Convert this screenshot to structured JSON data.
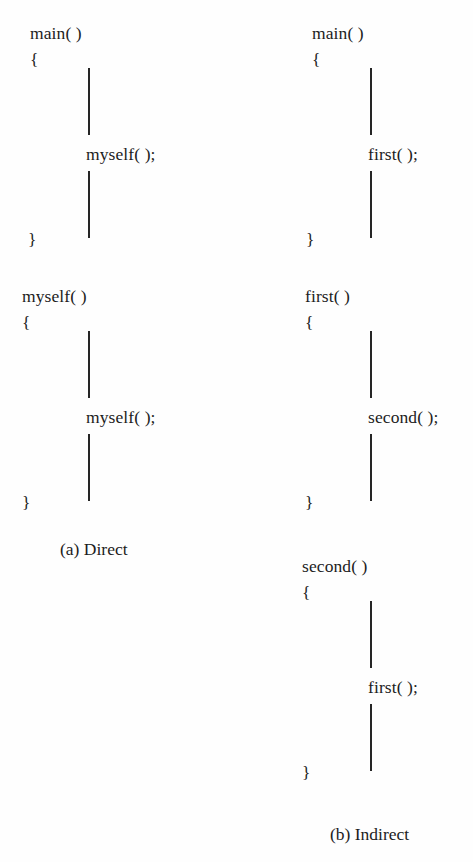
{
  "figure": {
    "title_alt": "Direct and Indirect Recursion",
    "background_color": "#ffffff",
    "text_color": "#1c1c1c",
    "line_color": "#262626"
  },
  "left_column": {
    "caption": "(a) Direct",
    "blocks": [
      {
        "name": "main-block",
        "header": "main( )",
        "open_brace": "{",
        "call": "myself( );",
        "close_brace": "}"
      },
      {
        "name": "myself-block",
        "header": "myself( )",
        "open_brace": "{",
        "call": "myself( );",
        "close_brace": "}"
      }
    ]
  },
  "right_column": {
    "caption": "(b) Indirect",
    "blocks": [
      {
        "name": "main-block",
        "header": "main( )",
        "open_brace": "{",
        "call": "first( );",
        "close_brace": "}"
      },
      {
        "name": "first-block",
        "header": "first( )",
        "open_brace": "{",
        "call": "second( );",
        "close_brace": "}"
      },
      {
        "name": "second-block",
        "header": "second( )",
        "open_brace": "{",
        "call": "first( );",
        "close_brace": "}"
      }
    ]
  }
}
